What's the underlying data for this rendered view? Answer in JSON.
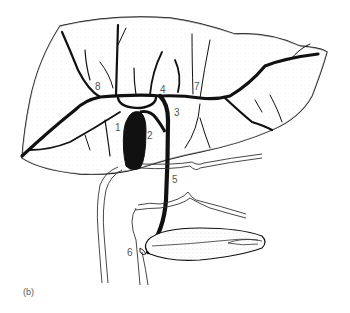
{
  "figure": {
    "panel_label": "(b)",
    "colors": {
      "ink": "#111111",
      "stipple": "#d8d8d8",
      "label": "#555555",
      "background": "#ffffff"
    },
    "labels": [
      {
        "id": "1",
        "text": "1",
        "x": 115,
        "y": 128
      },
      {
        "id": "2",
        "text": "2",
        "x": 147,
        "y": 133
      },
      {
        "id": "3",
        "text": "3",
        "x": 174,
        "y": 109
      },
      {
        "id": "4",
        "text": "4",
        "x": 160,
        "y": 87
      },
      {
        "id": "5",
        "text": "5",
        "x": 172,
        "y": 175
      },
      {
        "id": "6",
        "text": "6",
        "x": 127,
        "y": 248
      },
      {
        "id": "7",
        "text": "7",
        "x": 194,
        "y": 83
      },
      {
        "id": "8",
        "text": "8",
        "x": 95,
        "y": 83
      }
    ]
  }
}
